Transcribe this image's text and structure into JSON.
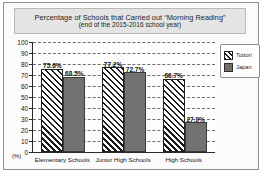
{
  "chart_data": {
    "type": "bar",
    "title": "Percentage of Schools that Carried out “Morning Reading”",
    "subtitle": "(end of the 2015-2016 school year)",
    "xlabel": "",
    "ylabel": "(%)",
    "ylim": [
      0,
      100
    ],
    "ytick_interval": 10,
    "yticks": [
      100,
      90,
      80,
      70,
      60,
      50,
      40,
      30,
      20,
      10,
      0
    ],
    "grid": true,
    "grid_style": "dashed-horizontal",
    "legend_position": "right",
    "categories": [
      "Elementary Schools",
      "Junior High Schools",
      "High Schools"
    ],
    "series": [
      {
        "name": "Tottori",
        "fill": "diagonal-hatch",
        "values": [
          75.6,
          77.2,
          66.7
        ],
        "labels": [
          "75.6%",
          "77.2%",
          "66.7%"
        ]
      },
      {
        "name": "Japan",
        "fill": "solid-gray",
        "color": "#727272",
        "values": [
          68.5,
          72.7,
          27.0
        ],
        "labels": [
          "68.5%",
          "72.7%",
          "27.0%"
        ]
      }
    ]
  },
  "colors": {
    "frame_border": "#8f8f8f",
    "title_band_bg": "#e4e4e4",
    "axis": "#2a2a2a",
    "gridline": "#6d6d6d",
    "series_b": "#727272",
    "text": "#141414"
  }
}
